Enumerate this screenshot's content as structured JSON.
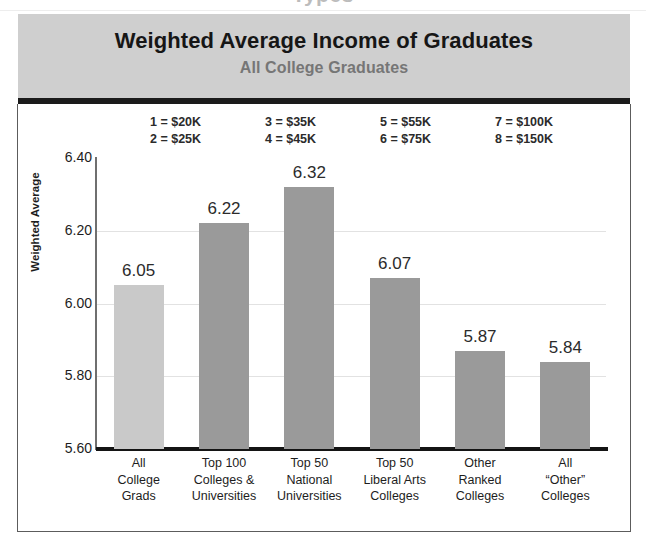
{
  "top_sliver_text": "Types",
  "header": {
    "title": "Weighted Average Income of Graduates",
    "subtitle": "All College Graduates"
  },
  "key": {
    "columns": [
      {
        "rows": [
          "1 = $20K",
          "2 = $25K"
        ]
      },
      {
        "rows": [
          "3 = $35K",
          "4 = $45K"
        ]
      },
      {
        "rows": [
          "5 = $55K",
          "6 = $75K"
        ]
      },
      {
        "rows": [
          "7 = $100K",
          "8 = $150K"
        ]
      }
    ]
  },
  "chart_data": {
    "type": "bar",
    "title": "Weighted Average Income of Graduates",
    "subtitle": "All College Graduates",
    "xlabel": "",
    "ylabel": "Weighted Average",
    "ylim": [
      5.6,
      6.4
    ],
    "ytick_step": 0.2,
    "ytick_labels": [
      "6.40",
      "6.20",
      "6.00",
      "5.80",
      "5.60"
    ],
    "ytick_values": [
      6.4,
      6.2,
      6.0,
      5.8,
      5.6
    ],
    "grid": true,
    "legend": "none",
    "categories": [
      "All College Grads",
      "Top 100 Colleges & Universities",
      "Top 50 National Universities",
      "Top 50 Liberal Arts Colleges",
      "Other Ranked Colleges",
      "All “Other” Colleges"
    ],
    "category_lines": [
      [
        "All",
        "College",
        "Grads"
      ],
      [
        "Top 100",
        "Colleges &",
        "Universities"
      ],
      [
        "Top 50",
        "National",
        "Universities"
      ],
      [
        "Top 50",
        "Liberal Arts",
        "Colleges"
      ],
      [
        "Other",
        "Ranked",
        "Colleges"
      ],
      [
        "All",
        "“Other”",
        "Colleges"
      ]
    ],
    "values": [
      6.05,
      6.22,
      6.32,
      6.07,
      5.87,
      5.84
    ],
    "value_labels": [
      "6.05",
      "6.22",
      "6.32",
      "6.07",
      "5.87",
      "5.84"
    ],
    "bar_colors": [
      "#c9c9c9",
      "#9a9a9a",
      "#9a9a9a",
      "#9a9a9a",
      "#9a9a9a",
      "#9a9a9a"
    ],
    "scale_key": {
      "1": "$20K",
      "2": "$25K",
      "3": "$35K",
      "4": "$45K",
      "5": "$55K",
      "6": "$75K",
      "7": "$100K",
      "8": "$150K"
    }
  },
  "colors": {
    "header_band": "#cfcfcf",
    "header_rule": "#1b1b1b",
    "bar_primary": "#9a9a9a",
    "bar_highlight": "#c9c9c9",
    "gridline": "#e2e2e2",
    "axis": "#141414",
    "frame": "#5c5c5c",
    "title_text": "#161616",
    "subtitle_text": "#767676"
  }
}
